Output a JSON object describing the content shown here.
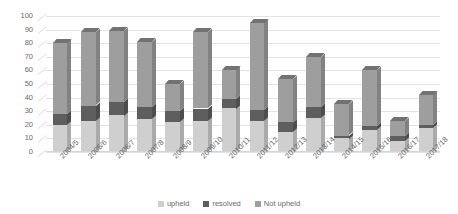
{
  "chart_data": {
    "type": "bar",
    "subtype": "stacked-bar-3d",
    "title": "",
    "xlabel": "",
    "ylabel": "",
    "ylim": [
      0,
      100
    ],
    "yticks": [
      0,
      10,
      20,
      30,
      40,
      50,
      60,
      70,
      80,
      90,
      100
    ],
    "grid": true,
    "legend_position": "bottom",
    "categories": [
      "2004/5",
      "2005/6",
      "2006/7",
      "2007/8",
      "2008/9",
      "2009/10",
      "2010/11",
      "2011/12",
      "2012/13",
      "2013/14",
      "2014/15",
      "2015/16",
      "2016/17",
      "2017/18"
    ],
    "series": [
      {
        "name": "upheld",
        "color": "#cfcfcf",
        "values": [
          20,
          23,
          27,
          24,
          22,
          23,
          32,
          23,
          15,
          25,
          10,
          16,
          8,
          18
        ]
      },
      {
        "name": "resolved",
        "color": "#5e5e5e",
        "values": [
          8,
          11,
          10,
          9,
          8,
          9,
          7,
          8,
          7,
          8,
          2,
          3,
          4,
          2
        ]
      },
      {
        "name": "Not upheld",
        "color": "#9e9e9e",
        "values": [
          52,
          54,
          52,
          48,
          20,
          56,
          21,
          64,
          32,
          37,
          23,
          41,
          11,
          22
        ]
      }
    ],
    "totals": [
      80,
      88,
      89,
      81,
      50,
      88,
      60,
      95,
      54,
      70,
      35,
      60,
      23,
      42
    ]
  },
  "legend": {
    "items": [
      {
        "label": "upheld",
        "color": "#cfcfcf"
      },
      {
        "label": "resolved",
        "color": "#5e5e5e"
      },
      {
        "label": "Not upheld",
        "color": "#9e9e9e"
      }
    ]
  }
}
